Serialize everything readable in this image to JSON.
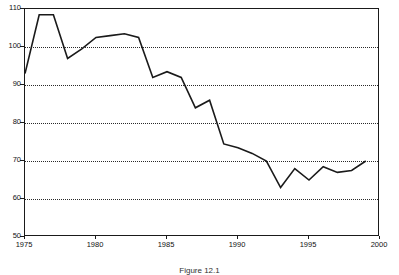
{
  "chart_data": {
    "type": "line",
    "title": "",
    "subtitle": "",
    "caption": "Figure 12.1",
    "xlabel": "",
    "ylabel": "",
    "xlim": [
      1975,
      2000
    ],
    "ylim": [
      50,
      110
    ],
    "grid": true,
    "grid_axis": "y",
    "legend": false,
    "legend_position": "none",
    "x_ticks": [
      1975,
      1980,
      1985,
      1990,
      1995,
      2000
    ],
    "x_tick_labels": [
      "1975",
      "1980",
      "1985",
      "1990",
      "1995",
      "2000"
    ],
    "y_ticks": [
      50,
      60,
      70,
      80,
      90,
      100,
      110
    ],
    "y_tick_labels": [
      "50",
      "60",
      "70",
      "80",
      "90",
      "100",
      "110"
    ],
    "line_color": "#1a1a1a",
    "line_width": 1.6,
    "x": [
      1975,
      1976,
      1977,
      1978,
      1979,
      1980,
      1981,
      1982,
      1983,
      1984,
      1985,
      1986,
      1987,
      1988,
      1989,
      1990,
      1991,
      1992,
      1993,
      1994,
      1995,
      1996,
      1997,
      1998,
      1999
    ],
    "series": [
      {
        "name": "value",
        "values": [
          93.0,
          108.5,
          108.5,
          97.0,
          99.5,
          102.5,
          103.0,
          103.5,
          102.5,
          92.0,
          93.5,
          92.0,
          84.0,
          86.0,
          74.5,
          73.5,
          72.0,
          70.0,
          63.0,
          68.0,
          65.0,
          68.5,
          67.0,
          67.5,
          70.0
        ]
      }
    ]
  }
}
